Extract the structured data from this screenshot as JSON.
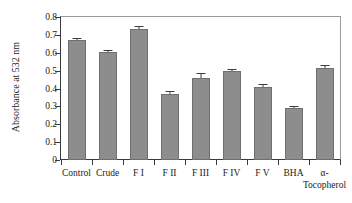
{
  "chart_data": {
    "type": "bar",
    "title": "",
    "xlabel": "",
    "ylabel": "Absorbance at 532 nm",
    "categories": [
      "Control",
      "Crude",
      "F I",
      "F II",
      "F III",
      "F IV",
      "F V",
      "BHA",
      "α-Tocopherol"
    ],
    "category_lines": [
      [
        "Control"
      ],
      [
        "Crude"
      ],
      [
        "F I"
      ],
      [
        "F II"
      ],
      [
        "F III"
      ],
      [
        "F IV"
      ],
      [
        "F V"
      ],
      [
        "BHA"
      ],
      [
        "α-",
        "Tocopherol"
      ]
    ],
    "values": [
      0.67,
      0.605,
      0.735,
      0.367,
      0.46,
      0.5,
      0.41,
      0.29,
      0.512
    ],
    "errors": [
      0.012,
      0.012,
      0.012,
      0.018,
      0.025,
      0.008,
      0.013,
      0.01,
      0.022
    ],
    "ylim": [
      0,
      0.8
    ],
    "ytick_labels": [
      "0.8",
      "0.7",
      "0.6",
      "0.5",
      "0.4",
      "0.3",
      "0.2",
      "0.1",
      "0"
    ],
    "ytick_values": [
      0.8,
      0.7,
      0.6,
      0.5,
      0.4,
      0.3,
      0.2,
      0.1,
      0
    ],
    "grid": false,
    "legend": null,
    "bar_color": "#8d8d8d",
    "bar_edge_color": "#6f6f6f",
    "axis_color": "#3a3a3a",
    "frame_color": "#9a9a9a",
    "text_color": "#1c1c1c"
  }
}
